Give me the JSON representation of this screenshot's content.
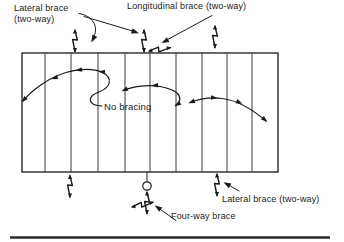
{
  "colors": {
    "ink": "#1a1a1a",
    "background": "#ffffff"
  },
  "labels": {
    "lateral_top": {
      "line1": "Lateral brace",
      "line2": "(two-way)"
    },
    "longitudinal_top": "Longitudinal brace (two-way)",
    "no_bracing": "No bracing",
    "lateral_bottom": "Lateral brace (two-way)",
    "four_way": "Four-way brace"
  },
  "symbols": {
    "lateral_brace_icon": "vertical zigzag two-way arrow bolt",
    "longitudinal_brace_icon": "horizontal zigzag two-way arrow bolt",
    "four_way_brace_icon": "crossed zigzag four-way arrow bolts",
    "brace_point_marker": "small circle at middle joist bottom chord"
  },
  "structure": {
    "joist_bays": 10,
    "interior_joist_lines": 9
  }
}
